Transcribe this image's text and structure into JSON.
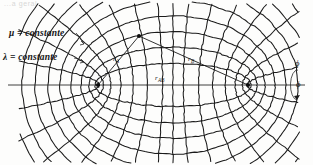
{
  "figure": {
    "kind": "confocal-elliptic-coordinate-grid",
    "header_fragment": "...a geral",
    "background_color": "#fdfdfc",
    "ink_color": "#1b1b1b",
    "labels": {
      "mu_constant": "μ = constante",
      "lambda_constant": "λ = constante",
      "r_a": "r",
      "r_a_sub": "A",
      "r_b": "r",
      "r_b_sub": "B",
      "r_ab": "r",
      "r_ab_sub": "AB",
      "phi_top": "ϕ",
      "phi_bottom": "ϕ"
    },
    "axis": {
      "y": 85,
      "x_start": 8,
      "x_end": 305
    },
    "foci": [
      {
        "name": "A",
        "x": 98,
        "y": 85
      },
      {
        "name": "B",
        "x": 248,
        "y": 85
      }
    ],
    "point_p": {
      "x": 139,
      "y": 36
    },
    "rays": [
      {
        "from": "point_p",
        "to": "A"
      },
      {
        "from": "point_p",
        "to": "B"
      }
    ],
    "leaders": [
      {
        "name": "mu-leader",
        "x1": 76,
        "y1": 33,
        "x2": 84,
        "y2": 44
      },
      {
        "name": "lambda-leader",
        "x1": 74,
        "y1": 58,
        "x2": 84,
        "y2": 62
      }
    ],
    "phi_rotation_arrow": {
      "cx": 291,
      "cy": 85,
      "rx": 7,
      "ry": 15
    }
  },
  "chart_data": {
    "type": "line",
    "title": "",
    "xlabel": "",
    "ylabel": "",
    "grid": true,
    "legend_position": "left",
    "focal_center_x": 173,
    "focal_center_y": 85,
    "focal_half_distance_c": 75,
    "lambda_family": {
      "label": "λ = constante",
      "curve": "confocal-ellipse",
      "parameter": "semi-major-axis-a",
      "values": [
        78,
        84,
        92,
        102,
        113,
        125,
        138,
        151,
        163
      ]
    },
    "mu_family": {
      "label": "μ = constante",
      "curve": "confocal-hyperbola",
      "parameter": "angle-theta-degrees",
      "values": [
        10,
        22,
        34,
        46,
        58,
        70,
        82,
        90,
        98,
        110,
        122,
        134,
        146,
        158,
        170
      ]
    },
    "annotated_points": [
      {
        "name": "A",
        "x": 98,
        "y": 85,
        "role": "focus"
      },
      {
        "name": "B",
        "x": 248,
        "y": 85,
        "role": "focus"
      },
      {
        "name": "P",
        "x": 139,
        "y": 36,
        "role": "field-point"
      }
    ],
    "annotated_segments": [
      {
        "name": "r_A",
        "from": "P",
        "to": "A"
      },
      {
        "name": "r_B",
        "from": "P",
        "to": "B"
      },
      {
        "name": "r_AB",
        "from": "A",
        "to": "B"
      }
    ]
  }
}
